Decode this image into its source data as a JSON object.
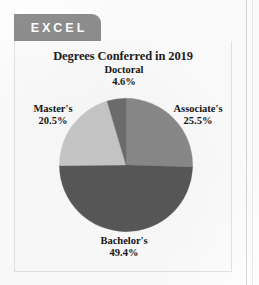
{
  "tab": {
    "label": "EXCEL"
  },
  "card": {
    "title": "Degrees Conferred in 2019"
  },
  "chart_data": {
    "type": "pie",
    "title": "Degrees Conferred in 2019",
    "xlabel": "",
    "ylabel": "",
    "legend_position": "none",
    "labels_position": "outside",
    "start_angle_deg": 0,
    "direction": "clockwise",
    "categories": [
      "Associate's",
      "Bachelor's",
      "Master's",
      "Doctoral"
    ],
    "values": [
      25.5,
      49.4,
      20.5,
      4.6
    ],
    "value_suffix": "%",
    "colors": [
      "#8a8a8a",
      "#585858",
      "#c9c9c9",
      "#6e6e6e"
    ],
    "slices": [
      {
        "label": "Associate's",
        "value": 25.5,
        "display": "25.5%",
        "color": "#8a8a8a"
      },
      {
        "label": "Bachelor's",
        "value": 49.4,
        "display": "49.4%",
        "color": "#585858"
      },
      {
        "label": "Master's",
        "value": 20.5,
        "display": "20.5%",
        "color": "#c9c9c9"
      },
      {
        "label": "Doctoral",
        "value": 4.6,
        "display": "4.6%",
        "color": "#6e6e6e"
      }
    ]
  },
  "labels": {
    "doctoral": {
      "name": "Doctoral",
      "pct": "4.6%"
    },
    "masters": {
      "name": "Master's",
      "pct": "20.5%"
    },
    "associates": {
      "name": "Associate's",
      "pct": "25.5%"
    },
    "bachelors": {
      "name": "Bachelor's",
      "pct": "49.4%"
    }
  },
  "colors": {
    "tab_background": "#8d8d8d",
    "tab_text": "#ffffff",
    "card_background": "#fcfcfc",
    "card_border": "#e2e2e2",
    "title_text": "#1c1c1c",
    "slice_associates": "#8a8a8a",
    "slice_bachelors": "#585858",
    "slice_masters": "#c9c9c9",
    "slice_doctoral": "#6e6e6e"
  }
}
